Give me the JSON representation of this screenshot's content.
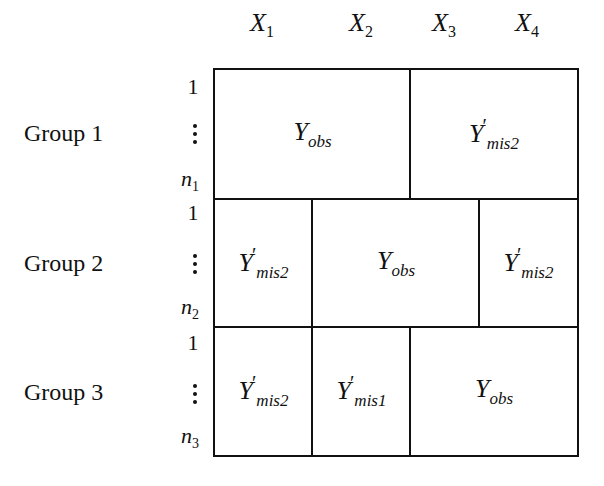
{
  "columns": [
    {
      "label": "X",
      "sub": "1",
      "x": 262
    },
    {
      "label": "X",
      "sub": "2",
      "x": 361
    },
    {
      "label": "X",
      "sub": "3",
      "x": 444
    },
    {
      "label": "X",
      "sub": "4",
      "x": 527
    }
  ],
  "groups": [
    {
      "label": "Group 1",
      "first": "1",
      "last_var": "n",
      "last_sub": "1"
    },
    {
      "label": "Group 2",
      "first": "1",
      "last_var": "n",
      "last_sub": "2"
    },
    {
      "label": "Group 3",
      "first": "1",
      "last_var": "n",
      "last_sub": "3"
    }
  ],
  "cells": {
    "g1_obs": {
      "main": "Y",
      "sub": "obs",
      "prime": ""
    },
    "g1_mis": {
      "main": "Y",
      "sub": "mis2",
      "prime": "′"
    },
    "g2_mis_left": {
      "main": "Y",
      "sub": "mis2",
      "prime": "′"
    },
    "g2_obs": {
      "main": "Y",
      "sub": "obs",
      "prime": ""
    },
    "g2_mis_right": {
      "main": "Y",
      "sub": "mis2",
      "prime": "′"
    },
    "g3_mis2": {
      "main": "Y",
      "sub": "mis2",
      "prime": "′"
    },
    "g3_mis1": {
      "main": "Y",
      "sub": "mis1",
      "prime": "′"
    },
    "g3_obs": {
      "main": "Y",
      "sub": "obs",
      "prime": ""
    }
  }
}
